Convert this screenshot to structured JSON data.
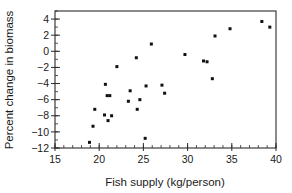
{
  "chart_data": {
    "type": "scatter",
    "title": "",
    "subtitle": "",
    "xlabel": "Fish supply (kg/person)",
    "ylabel": "Percent change in biomass",
    "xlim": [
      15,
      40
    ],
    "ylim": [
      -12,
      5
    ],
    "xticks": [
      15,
      20,
      25,
      30,
      35,
      40
    ],
    "xtick_labels": [
      "15",
      "20",
      "25",
      "30",
      "35",
      "40"
    ],
    "yticks": [
      4,
      2,
      0,
      -2,
      -4,
      -6,
      -8,
      -10,
      -12
    ],
    "ytick_labels": [
      "4",
      "2",
      "0",
      "−2",
      "−4",
      "−6",
      "−8",
      "−10",
      "−12"
    ],
    "x_minor_tick_step": 1,
    "y_minor_tick_step": 1,
    "grid": false,
    "legend": null,
    "legend_position": "none",
    "marker": "square",
    "marker_color": "#111111",
    "marker_size": 3,
    "annotations": [],
    "points": [
      {
        "x": 18.9,
        "y": -11.3
      },
      {
        "x": 19.3,
        "y": -9.3
      },
      {
        "x": 19.5,
        "y": -7.2
      },
      {
        "x": 20.6,
        "y": -7.9
      },
      {
        "x": 20.7,
        "y": -4.1
      },
      {
        "x": 20.9,
        "y": -5.5
      },
      {
        "x": 21.0,
        "y": -8.6
      },
      {
        "x": 21.2,
        "y": -5.5
      },
      {
        "x": 21.4,
        "y": -8.0
      },
      {
        "x": 22.0,
        "y": -1.9
      },
      {
        "x": 23.3,
        "y": -6.2
      },
      {
        "x": 23.5,
        "y": -4.9
      },
      {
        "x": 24.2,
        "y": -0.8
      },
      {
        "x": 24.3,
        "y": -7.2
      },
      {
        "x": 24.6,
        "y": -6.0
      },
      {
        "x": 25.2,
        "y": -10.8
      },
      {
        "x": 25.3,
        "y": -4.3
      },
      {
        "x": 25.9,
        "y": 0.9
      },
      {
        "x": 27.1,
        "y": -4.2
      },
      {
        "x": 27.4,
        "y": -5.2
      },
      {
        "x": 29.7,
        "y": -0.4
      },
      {
        "x": 31.8,
        "y": -1.2
      },
      {
        "x": 32.2,
        "y": -1.3
      },
      {
        "x": 32.8,
        "y": -3.4
      },
      {
        "x": 33.1,
        "y": 1.9
      },
      {
        "x": 34.8,
        "y": 2.8
      },
      {
        "x": 38.4,
        "y": 3.7
      },
      {
        "x": 39.3,
        "y": 3.0
      }
    ]
  },
  "icons": {
    "point_marker": "square-marker-icon"
  }
}
